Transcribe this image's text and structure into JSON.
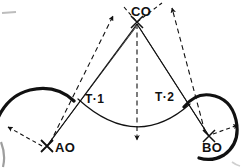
{
  "figure": {
    "type": "line-drawing",
    "width": 242,
    "height": 168,
    "background_color": "#ffffff",
    "ink_color": "#111111"
  },
  "labels": {
    "center_top": "CO",
    "tangent_left": "T·1",
    "tangent_right": "T·2",
    "center_left": "AO",
    "center_right": "BO"
  },
  "points": {
    "co": {
      "x": 137,
      "y": 22,
      "marker": "x-cross",
      "label_dx": 14,
      "label_dy": -4
    },
    "ao": {
      "x": 47,
      "y": 146,
      "marker": "x-cross",
      "label_dx": 9,
      "label_dy": 4
    },
    "bo": {
      "x": 209,
      "y": 136,
      "marker": "x-cross",
      "label_dx": -4,
      "label_dy": 14
    },
    "t1": {
      "x": 78,
      "y": 99,
      "marker": "none",
      "label_dx": 7,
      "label_dy": 1
    },
    "t2": {
      "x": 190,
      "y": 104,
      "marker": "none",
      "label_dx": -35,
      "label_dy": -3
    }
  },
  "strokes": {
    "thick_arc_width": 3.2,
    "thin_arc_width": 1.1,
    "solid_line_width": 1.2,
    "dashed_line_width": 1.1,
    "dash_pattern": "5,3.5"
  },
  "geometry": {
    "left_arc_note": "convex arc over AO",
    "right_arc_note": "near-full circle arc around BO",
    "middle_arc_note": "concave sagging arc from T·1 to T·2",
    "center_drop_note": "vertical dashed arrow CO down to middle arc"
  }
}
